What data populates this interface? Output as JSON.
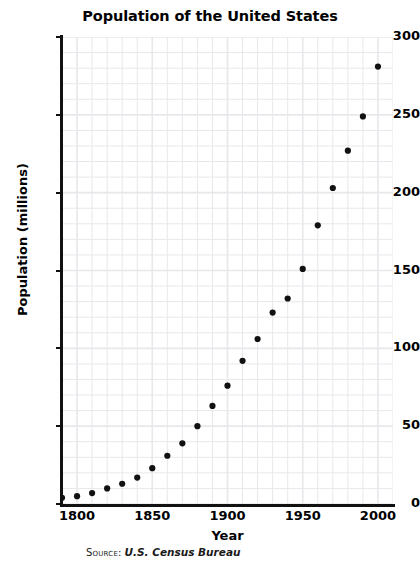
{
  "chart_data": {
    "type": "scatter",
    "title": "Population of the United States",
    "xlabel": "Year",
    "ylabel": "Population (millions)",
    "xlim": [
      1790,
      2010
    ],
    "ylim": [
      0,
      300
    ],
    "grid": true,
    "legend": null,
    "x_ticks": [
      1800,
      1850,
      1900,
      1950,
      2000
    ],
    "x_tick_labels": [
      "1800",
      "1850",
      "1900",
      "1950",
      "2000"
    ],
    "y_ticks": [
      0,
      50,
      100,
      150,
      200,
      250,
      300
    ],
    "y_tick_labels": [
      "0",
      "50",
      "100",
      "150",
      "200",
      "250",
      "300"
    ],
    "x_minor_step": 10,
    "y_minor_step": 10,
    "marker": "circle",
    "marker_color": "#111111",
    "grid_color": "#e8e8ec",
    "x": [
      1790,
      1800,
      1810,
      1820,
      1830,
      1840,
      1850,
      1860,
      1870,
      1880,
      1890,
      1900,
      1910,
      1920,
      1930,
      1940,
      1950,
      1960,
      1970,
      1980,
      1990,
      2000
    ],
    "values": [
      4,
      5,
      7,
      10,
      13,
      17,
      23,
      31,
      39,
      50,
      63,
      76,
      92,
      106,
      123,
      132,
      151,
      179,
      203,
      227,
      249,
      281
    ],
    "annotations": {
      "source_label": "Source:",
      "source_value": "U.S. Census Bureau"
    }
  },
  "axis": {
    "y_title": "Population (millions)",
    "x_title": "Year"
  }
}
